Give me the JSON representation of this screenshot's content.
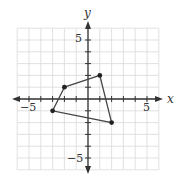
{
  "chart_data": {
    "type": "scatter",
    "title": "",
    "xlabel": "x",
    "ylabel": "y",
    "xlim": [
      -6,
      6
    ],
    "ylim": [
      -6,
      6
    ],
    "grid": true,
    "tick_labels": {
      "x": [
        "-5",
        "5"
      ],
      "y": [
        "5",
        "-5"
      ]
    },
    "series": [
      {
        "name": "quadrilateral",
        "closed": true,
        "points": [
          {
            "x": -2,
            "y": 1
          },
          {
            "x": 1,
            "y": 2
          },
          {
            "x": 2,
            "y": -2
          },
          {
            "x": -3,
            "y": -1
          }
        ]
      }
    ]
  },
  "labels": {
    "x_axis": "x",
    "y_axis": "y",
    "x_neg5": "−5",
    "x_pos5": "5",
    "y_pos5": "5",
    "y_neg5": "−5"
  },
  "colors": {
    "grid": "#d9d9d9",
    "axis": "#333333",
    "shape": "#444444",
    "point": "#222222"
  }
}
